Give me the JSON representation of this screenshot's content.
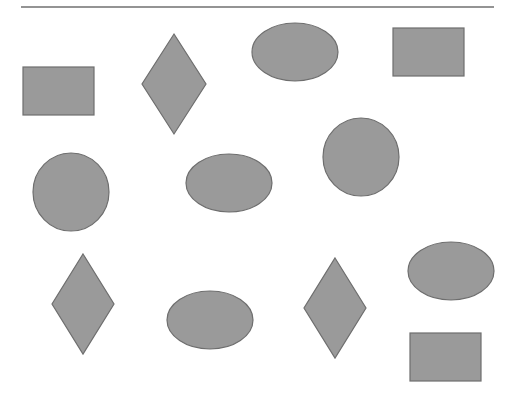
{
  "canvas": {
    "width": 520,
    "height": 405,
    "background": "#ffffff"
  },
  "style": {
    "fill": "#9a9a9a",
    "stroke": "#6e6e6e",
    "stroke_width": 1.2
  },
  "top_rule": {
    "x1": 21,
    "x2": 494,
    "y": 7,
    "color": "#707070"
  },
  "shapes": [
    {
      "type": "rect",
      "name": "rectangle-1",
      "x": 23,
      "y": 67,
      "w": 71,
      "h": 48
    },
    {
      "type": "diamond",
      "name": "diamond-1",
      "cx": 174,
      "cy": 84,
      "rx": 32,
      "ry": 50
    },
    {
      "type": "ellipse",
      "name": "ellipse-1",
      "cx": 295,
      "cy": 52,
      "rx": 43,
      "ry": 29
    },
    {
      "type": "rect",
      "name": "rectangle-2",
      "x": 393,
      "y": 28,
      "w": 71,
      "h": 48
    },
    {
      "type": "circle",
      "name": "circle-1",
      "cx": 71,
      "cy": 192,
      "rx": 38,
      "ry": 39
    },
    {
      "type": "ellipse",
      "name": "ellipse-2",
      "cx": 229,
      "cy": 183,
      "rx": 43,
      "ry": 29
    },
    {
      "type": "circle",
      "name": "circle-2",
      "cx": 361,
      "cy": 157,
      "rx": 38,
      "ry": 39
    },
    {
      "type": "diamond",
      "name": "diamond-2",
      "cx": 83,
      "cy": 304,
      "rx": 31,
      "ry": 50
    },
    {
      "type": "ellipse",
      "name": "ellipse-3",
      "cx": 210,
      "cy": 320,
      "rx": 43,
      "ry": 29
    },
    {
      "type": "diamond",
      "name": "diamond-3",
      "cx": 335,
      "cy": 308,
      "rx": 31,
      "ry": 50
    },
    {
      "type": "ellipse",
      "name": "ellipse-4",
      "cx": 451,
      "cy": 271,
      "rx": 43,
      "ry": 29
    },
    {
      "type": "rect",
      "name": "rectangle-3",
      "x": 410,
      "y": 333,
      "w": 71,
      "h": 48
    }
  ]
}
